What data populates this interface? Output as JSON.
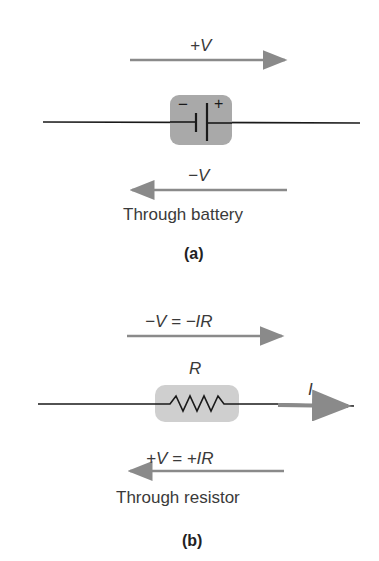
{
  "panel_a": {
    "top_label": "+V",
    "bottom_label": "−V",
    "caption": "Through battery",
    "sublabel": "(a)",
    "battery_minus": "−",
    "battery_plus": "+"
  },
  "panel_b": {
    "top_label": "−V = −IR",
    "resistor_label": "R",
    "current_label": "I",
    "bottom_label": "+V = +IR",
    "caption": "Through resistor",
    "sublabel": "(b)"
  },
  "colors": {
    "arrow": "#8a8a8a",
    "wire": "#1a1a1a",
    "component_bg": "#a9a9a9",
    "resistor_bg": "#cfcfcf"
  }
}
